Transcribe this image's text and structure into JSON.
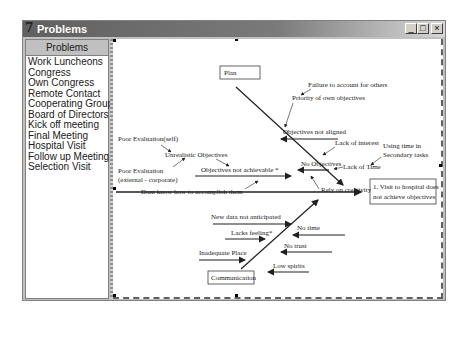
{
  "window": {
    "title": "Problems",
    "icon": "app-icon",
    "controls": {
      "minimize": "_",
      "maximize": "□",
      "close": "×"
    }
  },
  "sidebar": {
    "header": "Problems",
    "items": [
      {
        "label": "Work Luncheons"
      },
      {
        "label": "Congress"
      },
      {
        "label": "Own Congress"
      },
      {
        "label": "Remote Contact"
      },
      {
        "label": "Cooperating Groups"
      },
      {
        "label": "Board of Directors"
      },
      {
        "label": "Kick off meeting"
      },
      {
        "label": "Final Meeting"
      },
      {
        "label": "Hospital Visit"
      },
      {
        "label": "Follow up Meeting"
      },
      {
        "label": "Selection Visit"
      }
    ]
  },
  "diagram": {
    "effect": [
      "1. Visit to hospital does",
      "not achieve objectives"
    ],
    "categories": {
      "plan": "Plan",
      "communication": "Communication"
    },
    "causes": {
      "failure_account": "Failure to account for others",
      "priority_own": "Priority of own objectives",
      "objectives_not_aligned": "Objectives not aligned",
      "lack_interest": "Lack of interest",
      "using_time": [
        "Using time in",
        "Secondary tasks"
      ],
      "no_objectives": "No Objectives",
      "lack_time": "Lack of Time",
      "rely_creativity": "Rely on creativity",
      "poor_eval_self": "Poor Evaluation(self)",
      "unrealistic": "Unrealistic Objectives",
      "poor_eval_ext": [
        "Poor Evaluation",
        "(external - corporate)"
      ],
      "not_achievable": "Objectives not achievable *",
      "dont_know": "Dont know how to accomplish them",
      "new_data": "New data not anticipated",
      "no_time": "No time",
      "lacks_feeling": "Lacks feeling*",
      "no_trust": "No trust",
      "inadequate_place": "Inadequate Place",
      "low_spirits": "Low spirits"
    }
  }
}
